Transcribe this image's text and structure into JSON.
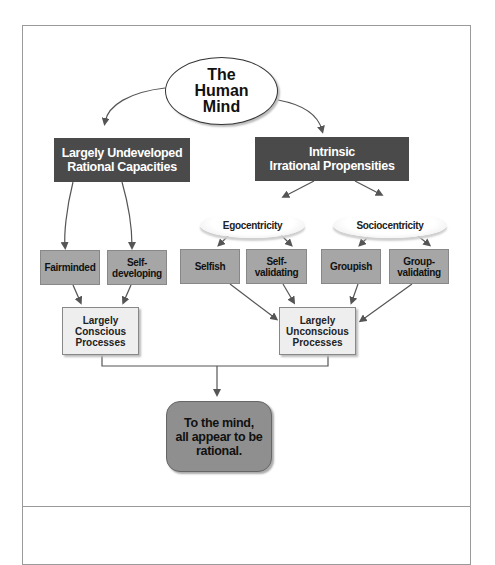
{
  "diagram": {
    "root": {
      "label": "The\nHuman\nMind"
    },
    "branches": [
      {
        "label": "Largely Undeveloped\nRational Capacities"
      },
      {
        "label": "Intrinsic\nIrrational Propensities"
      }
    ],
    "clouds": [
      {
        "label": "Egocentricity"
      },
      {
        "label": "Sociocentricity"
      }
    ],
    "traits": [
      {
        "label": "Fairminded"
      },
      {
        "label": "Self-\ndeveloping"
      },
      {
        "label": "Selfish"
      },
      {
        "label": "Self-\nvalidating"
      },
      {
        "label": "Groupish"
      },
      {
        "label": "Group-\nvalidating"
      }
    ],
    "processes": [
      {
        "label": "Largely\nConscious\nProcesses"
      },
      {
        "label": "Largely\nUnconscious\nProcesses"
      }
    ],
    "conclusion": {
      "label": "To the mind,\nall appear to be\nrational."
    },
    "colors": {
      "dark_box": "#4a4a4a",
      "mid_box": "#a6a6a6",
      "light_box": "#eeeeee",
      "final_box": "#8f8f8f",
      "line": "#555555"
    }
  }
}
